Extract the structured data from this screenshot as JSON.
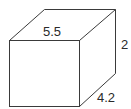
{
  "diagram": {
    "type": "rectangular-prism",
    "labels": {
      "length": "5.5",
      "height": "2",
      "depth": "4.2"
    },
    "colors": {
      "edge": "#3a3a3a",
      "text": "#2a2a2a",
      "background": "#ffffff"
    }
  }
}
